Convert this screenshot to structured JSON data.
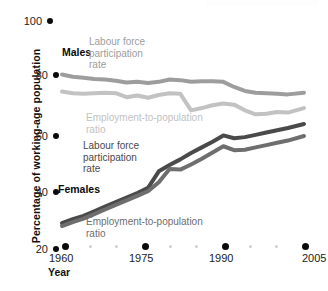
{
  "chart_data": {
    "type": "line",
    "title": "",
    "xlabel": "Year",
    "ylabel": "Percentage of working-age population",
    "xlim": [
      1960,
      2005
    ],
    "ylim": [
      20,
      100
    ],
    "yticks": [
      20,
      40,
      60,
      80,
      100
    ],
    "xticks": [
      1960,
      1975,
      1990,
      2005
    ],
    "xminorticks": [
      1965,
      1970,
      1980,
      1985,
      1995,
      2000
    ],
    "grid": false,
    "legend": "inline annotations on series",
    "series": [
      {
        "name": "Males Labour force participation rate",
        "group": "Males",
        "measure": "Labour force participation rate",
        "color": "#9d9d9d",
        "x": [
          1960,
          1962,
          1964,
          1966,
          1968,
          1970,
          1972,
          1974,
          1976,
          1978,
          1980,
          1982,
          1984,
          1986,
          1988,
          1990,
          1992,
          1994,
          1996,
          1998,
          2000,
          2002,
          2005
        ],
        "values": [
          80.2,
          79.4,
          79.0,
          78.6,
          78.4,
          78.0,
          77.4,
          77.6,
          77.2,
          77.6,
          78.4,
          78.2,
          77.6,
          77.8,
          77.8,
          77.6,
          75.8,
          74.4,
          73.8,
          73.6,
          73.4,
          73.2,
          73.8
        ]
      },
      {
        "name": "Males Employment-to-population ratio",
        "group": "Males",
        "measure": "Employment-to-population ratio",
        "color": "#c2c2c2",
        "x": [
          1960,
          1962,
          1964,
          1966,
          1968,
          1970,
          1972,
          1974,
          1976,
          1978,
          1980,
          1982,
          1984,
          1986,
          1988,
          1990,
          1992,
          1994,
          1996,
          1998,
          2000,
          2002,
          2005
        ],
        "values": [
          74.2,
          73.6,
          73.4,
          73.6,
          73.8,
          73.6,
          72.2,
          72.8,
          72.0,
          73.0,
          73.6,
          73.4,
          67.6,
          68.4,
          69.4,
          70.0,
          69.6,
          67.6,
          66.2,
          66.4,
          67.0,
          66.8,
          68.4
        ]
      },
      {
        "name": "Females Labour force participation rate",
        "group": "Females",
        "measure": "Labour force participation rate",
        "color": "#4a4a4a",
        "x": [
          1960,
          1962,
          1964,
          1966,
          1968,
          1970,
          1972,
          1974,
          1976,
          1978,
          1980,
          1982,
          1984,
          1986,
          1988,
          1990,
          1992,
          1994,
          1996,
          1998,
          2000,
          2002,
          2005
        ],
        "values": [
          28.0,
          29.4,
          30.6,
          32.2,
          33.8,
          35.4,
          37.0,
          38.6,
          40.4,
          46.2,
          48.4,
          50.4,
          52.6,
          54.6,
          56.6,
          58.8,
          57.8,
          58.2,
          59.0,
          59.8,
          60.6,
          61.4,
          62.8
        ]
      },
      {
        "name": "Females Employment-to-population ratio",
        "group": "Females",
        "measure": "Employment-to-population ratio",
        "color": "#6e6e6e",
        "x": [
          1960,
          1962,
          1964,
          1966,
          1968,
          1970,
          1972,
          1974,
          1976,
          1978,
          1980,
          1982,
          1984,
          1986,
          1988,
          1990,
          1992,
          1994,
          1996,
          1998,
          2000,
          2002,
          2005
        ],
        "values": [
          27.0,
          28.4,
          29.6,
          31.2,
          32.8,
          34.4,
          36.0,
          37.6,
          39.2,
          42.4,
          47.0,
          46.8,
          48.6,
          50.6,
          52.8,
          55.0,
          53.6,
          53.8,
          54.6,
          55.4,
          56.2,
          57.0,
          58.6
        ]
      }
    ]
  },
  "axes": {
    "y_title": "Percentage of working-age population",
    "x_title": "Year",
    "y_ticks": [
      {
        "label": "100"
      },
      {
        "label": "80"
      },
      {
        "label": "60"
      },
      {
        "label": "40"
      },
      {
        "label": "20"
      }
    ],
    "x_ticks": [
      {
        "label": "1960"
      },
      {
        "label": "1975"
      },
      {
        "label": "1990"
      },
      {
        "label": "2005"
      }
    ]
  },
  "annotations": {
    "males_label": "Males",
    "males_lfpr": "Labour force\nparticipation\nrate",
    "males_epr": "Employment-to-population\nratio",
    "females_label": "Females",
    "females_lfpr": "Labour force\nparticipation\nrate",
    "females_epr": "Employment-to-population\nratio"
  }
}
